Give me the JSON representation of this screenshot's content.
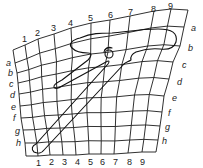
{
  "diagram": {
    "grid": {
      "columns": 10,
      "rows": 9,
      "column_labels": [
        "1",
        "2",
        "3",
        "4",
        "5",
        "6",
        "7",
        "8",
        "9"
      ],
      "row_labels": [
        "a",
        "b",
        "c",
        "d",
        "e",
        "f",
        "g",
        "h"
      ],
      "top_edge": [
        [
          13,
          50
        ],
        [
          25,
          45
        ],
        [
          38,
          39
        ],
        [
          54,
          34
        ],
        [
          71,
          28
        ],
        [
          91,
          23
        ],
        [
          110,
          20
        ],
        [
          130,
          16
        ],
        [
          154,
          11
        ],
        [
          171,
          9
        ],
        [
          188,
          10
        ]
      ],
      "bottom_edge": [
        [
          26,
          156
        ],
        [
          38,
          156
        ],
        [
          50,
          155
        ],
        [
          63,
          155
        ],
        [
          76,
          155
        ],
        [
          89,
          154
        ],
        [
          101,
          154
        ],
        [
          114,
          154
        ],
        [
          128,
          153
        ],
        [
          142,
          152
        ],
        [
          156,
          152
        ]
      ],
      "left_edge": [
        [
          13,
          50
        ],
        [
          15,
          63
        ],
        [
          17,
          73
        ],
        [
          18,
          83
        ],
        [
          19,
          94
        ],
        [
          20,
          106
        ],
        [
          21,
          118
        ],
        [
          23,
          130
        ],
        [
          25,
          143
        ],
        [
          26,
          156
        ]
      ],
      "right_edge": [
        [
          188,
          10
        ],
        [
          184,
          27
        ],
        [
          180,
          46
        ],
        [
          173,
          62
        ],
        [
          169,
          79
        ],
        [
          164,
          96
        ],
        [
          162,
          112
        ],
        [
          160,
          126
        ],
        [
          158,
          140
        ],
        [
          156,
          152
        ]
      ]
    },
    "labels": {
      "top": [
        {
          "text": "1",
          "x": 22,
          "y": 42
        },
        {
          "text": "2",
          "x": 35,
          "y": 36
        },
        {
          "text": "3",
          "x": 51,
          "y": 31
        },
        {
          "text": "4",
          "x": 68,
          "y": 26
        },
        {
          "text": "5",
          "x": 88,
          "y": 21
        },
        {
          "text": "6",
          "x": 108,
          "y": 18
        },
        {
          "text": "7",
          "x": 128,
          "y": 15
        },
        {
          "text": "8",
          "x": 151,
          "y": 12
        },
        {
          "text": "9",
          "x": 168,
          "y": 9
        }
      ],
      "bottom": [
        {
          "text": "1",
          "x": 36,
          "y": 166
        },
        {
          "text": "2",
          "x": 49,
          "y": 165
        },
        {
          "text": "3",
          "x": 62,
          "y": 165
        },
        {
          "text": "4",
          "x": 75,
          "y": 165
        },
        {
          "text": "5",
          "x": 88,
          "y": 165
        },
        {
          "text": "6",
          "x": 100,
          "y": 165
        },
        {
          "text": "7",
          "x": 113,
          "y": 165
        },
        {
          "text": "8",
          "x": 127,
          "y": 165
        },
        {
          "text": "9",
          "x": 140,
          "y": 165
        }
      ],
      "left": [
        {
          "text": "a",
          "x": 6,
          "y": 66
        },
        {
          "text": "b",
          "x": 8,
          "y": 76
        },
        {
          "text": "c",
          "x": 9,
          "y": 87
        },
        {
          "text": "d",
          "x": 10,
          "y": 98
        },
        {
          "text": "e",
          "x": 11,
          "y": 110
        },
        {
          "text": "f",
          "x": 13,
          "y": 121
        },
        {
          "text": "g",
          "x": 15,
          "y": 134
        },
        {
          "text": "h",
          "x": 16,
          "y": 146
        }
      ],
      "right": [
        {
          "text": "a",
          "x": 191,
          "y": 31
        },
        {
          "text": "b",
          "x": 188,
          "y": 51
        },
        {
          "text": "c",
          "x": 182,
          "y": 68
        },
        {
          "text": "d",
          "x": 177,
          "y": 85
        },
        {
          "text": "e",
          "x": 172,
          "y": 101
        },
        {
          "text": "f",
          "x": 168,
          "y": 116
        },
        {
          "text": "g",
          "x": 165,
          "y": 130
        },
        {
          "text": "h",
          "x": 162,
          "y": 144
        }
      ]
    },
    "shape": {
      "name": "hammer-outline",
      "path": "M 72 48 C 68 44, 72 40, 80 38 C 92 33, 100 33, 112 33 C 125 32, 140 29, 158 29 C 172 29, 178 33, 176 42 C 174 48, 168 50, 160 49 C 150 48, 142 50, 136 52 C 132 54, 130 56, 131 60 C 128 62, 126 62, 124 64 L 44 150 C 42 153, 38 154, 34 152 C 31 149, 32 146, 36 144 L 108 64 C 110 61, 109 60, 106 62 L 62 86 C 58 89, 54 89, 54 87 C 53 84, 58 82, 62 80 L 88 60 C 92 56, 92 53, 88 53 C 82 53, 76 52, 72 48 Z",
      "eye": {
        "cx": 109,
        "cy": 54,
        "r": 4
      }
    }
  }
}
